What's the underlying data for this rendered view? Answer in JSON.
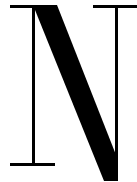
{
  "glyph": {
    "character": "N",
    "style": "serif",
    "color": "#000000",
    "background": "#ffffff"
  }
}
